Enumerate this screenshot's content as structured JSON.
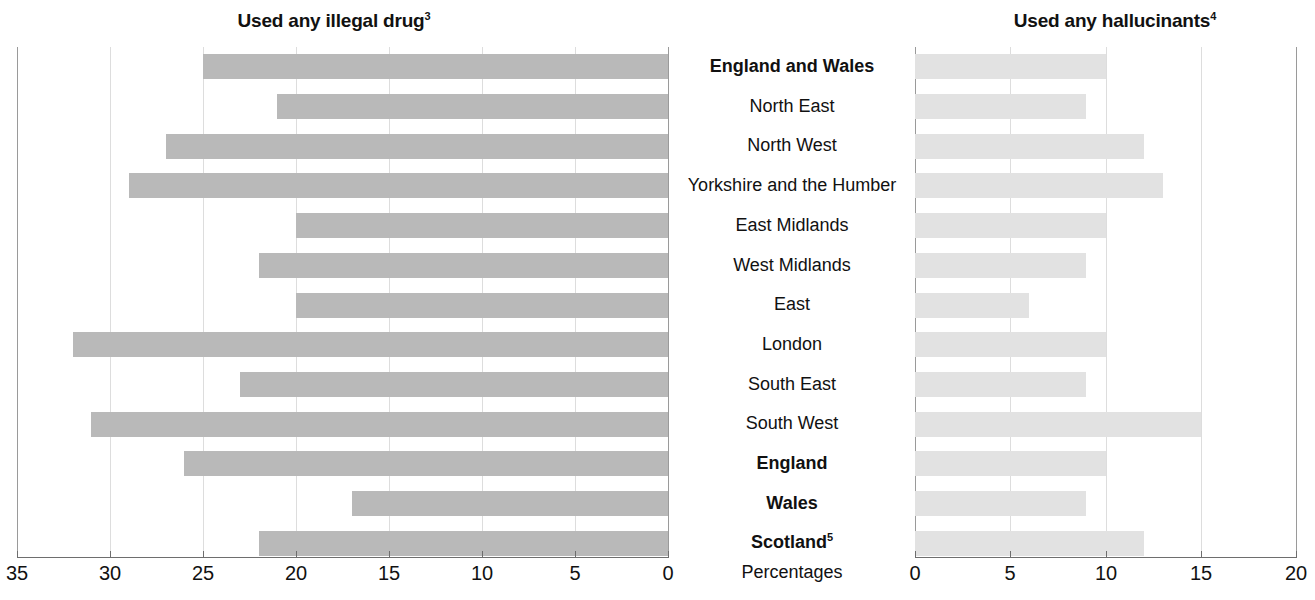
{
  "chart_data": {
    "type": "bar",
    "orientation": "horizontal",
    "layout": "paired-butterfly",
    "grid": true,
    "legend": null,
    "axis_unit_label": "Percentages",
    "categories": [
      "England and Wales",
      "North East",
      "North West",
      "Yorkshire and the Humber",
      "East Midlands",
      "West Midlands",
      "East",
      "London",
      "South East",
      "South West",
      "England",
      "Wales",
      "Scotland"
    ],
    "category_styles": [
      "bold",
      "normal",
      "normal",
      "normal",
      "normal",
      "normal",
      "normal",
      "normal",
      "normal",
      "normal",
      "bold",
      "bold",
      "bold"
    ],
    "category_footnotes": [
      "",
      "",
      "",
      "",
      "",
      "",
      "",
      "",
      "",
      "",
      "",
      "",
      "5"
    ],
    "panels": [
      {
        "id": "left",
        "title": "Used any illegal drug",
        "title_footnote": "3",
        "direction": "right-to-left",
        "xlim": [
          0,
          35
        ],
        "ticks": [
          35,
          30,
          25,
          20,
          15,
          10,
          5,
          0
        ],
        "tick_labels": [
          "35",
          "30",
          "25",
          "20",
          "15",
          "10",
          "5",
          "0"
        ],
        "values": [
          25,
          21,
          27,
          29,
          20,
          22,
          20,
          32,
          23,
          31,
          26,
          17,
          22
        ],
        "bar_color": "#b9b9b9"
      },
      {
        "id": "right",
        "title": "Used any hallucinants",
        "title_footnote": "4",
        "direction": "left-to-right",
        "xlim": [
          0,
          20
        ],
        "ticks": [
          0,
          5,
          10,
          15,
          20
        ],
        "tick_labels": [
          "0",
          "5",
          "10",
          "15",
          "20"
        ],
        "values": [
          10,
          9,
          12,
          13,
          10,
          9,
          6,
          10,
          9,
          15,
          10,
          9,
          12
        ],
        "bar_color": "#e2e2e2"
      }
    ],
    "colors": {
      "background": "#ffffff",
      "text": "#111111",
      "gridline": "#dddddd",
      "axis": "#6e6e6e",
      "bar_left": "#b9b9b9",
      "bar_right": "#e2e2e2"
    }
  }
}
